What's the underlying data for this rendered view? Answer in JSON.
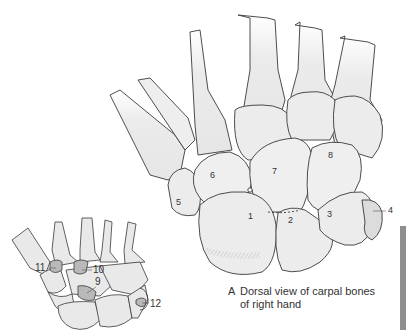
{
  "figure": {
    "panel_letter": "A",
    "caption_line1": "Dorsal view of carpal bones",
    "caption_line2": "of right hand",
    "colors": {
      "bone_fill": "#e9e9e9",
      "bone_shade": "#d6d6d6",
      "outline": "#3a3a3a",
      "highlight_fill": "#b9b9b9",
      "side_bar": "#8e8e8e"
    },
    "main_labels": [
      "1",
      "2",
      "3",
      "4",
      "5",
      "6",
      "7",
      "8"
    ],
    "inset_labels": [
      "9",
      "10",
      "11",
      "12"
    ]
  }
}
